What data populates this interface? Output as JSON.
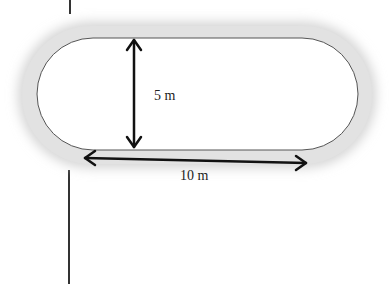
{
  "diagram": {
    "shape": "stadium",
    "width_label": "10 m",
    "height_label": "5 m",
    "colors": {
      "track_fill": "#ffffff",
      "track_border": "#555555",
      "shadow": "#d9d9d9",
      "arrow": "#111111",
      "line": "#333333"
    }
  }
}
